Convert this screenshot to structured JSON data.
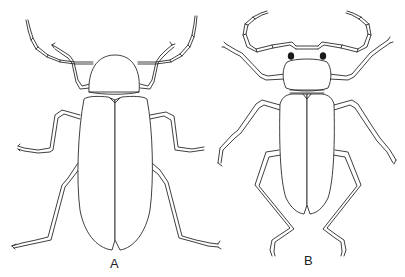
{
  "figure": {
    "type": "scientific-illustration",
    "panels": [
      {
        "id": "A",
        "label": "A",
        "description": "beetle with rounded pronotum, long parallel elytra, filiform antennae"
      },
      {
        "id": "B",
        "label": "B",
        "description": "beetle with transverse pronotum, dark eyes, short elytra, long legs"
      }
    ]
  },
  "colors": {
    "background": "#ffffff",
    "line": "#2a2a2a",
    "eye": "#1a1a1a"
  }
}
